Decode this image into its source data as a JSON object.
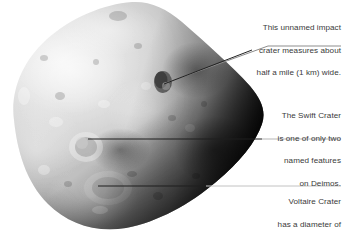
{
  "image": {
    "subject": "Deimos",
    "type": "grayscale-moon-photograph",
    "background_color": "#ffffff",
    "body_fill_light": "#e9e9e9",
    "body_fill_mid": "#9a9a9a",
    "body_fill_dark": "#1a1a1a"
  },
  "annotations": {
    "unnamed_crater": {
      "name": "unnamed-impact-crater-callout",
      "lines": [
        "This unnamed impact",
        "crater measures about",
        "half a mile (1 km) wide."
      ],
      "leader": {
        "type": "elbow",
        "points": "341,46 268,46 163,84"
      }
    },
    "swift_crater": {
      "name": "swift-crater-callout",
      "lines": [
        "The Swift Crater",
        "is one of only two",
        "named features",
        "on Deimos."
      ],
      "leader": {
        "type": "horizontal",
        "points": "341,139 88,139"
      }
    },
    "voltaire_crater": {
      "name": "voltaire-crater-callout",
      "lines": [
        "Voltaire Crater",
        "has a diameter of",
        "1.2 miles (1.9 km)."
      ],
      "leader": {
        "type": "horizontal",
        "points": "341,186 98,186"
      }
    }
  },
  "style": {
    "text_color": "#3a3a3a",
    "leader_color_light": "#b9b9b9",
    "leader_color_dark": "#2b2b2b"
  }
}
